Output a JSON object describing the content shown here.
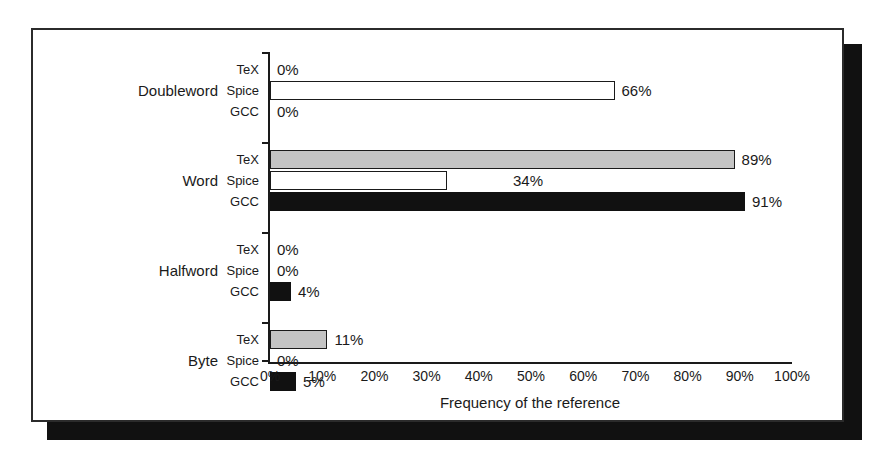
{
  "figure": {
    "x_axis_title": "Frequency of the reference",
    "frame_color": "#2b2b2b",
    "shadow_color": "#111111"
  },
  "chart_data": {
    "type": "bar",
    "orientation": "horizontal",
    "title": "",
    "subtitle": "",
    "xlabel": "Frequency of the reference",
    "ylabel": "",
    "xlim": [
      0,
      100
    ],
    "x_tick_labels": [
      "0%",
      "10%",
      "20%",
      "30%",
      "40%",
      "50%",
      "60%",
      "70%",
      "80%",
      "90%",
      "100%"
    ],
    "x_ticks": [
      0,
      10,
      20,
      30,
      40,
      50,
      60,
      70,
      80,
      90,
      100
    ],
    "grid": false,
    "legend_position": "none",
    "categories": [
      "Doubleword",
      "Word",
      "Halfword",
      "Byte"
    ],
    "series": [
      {
        "name": "TeX",
        "color": "#c4c4c4",
        "values": [
          0,
          89,
          0,
          11
        ]
      },
      {
        "name": "Spice",
        "color": "#ffffff",
        "values": [
          66,
          34,
          0,
          0
        ]
      },
      {
        "name": "GCC",
        "color": "#111111",
        "values": [
          0,
          91,
          4,
          5
        ]
      }
    ],
    "data_labels": {
      "Doubleword": {
        "TeX": "0%",
        "Spice": "66%",
        "GCC": "0%"
      },
      "Word": {
        "TeX": "89%",
        "Spice": "34%",
        "GCC": "91%"
      },
      "Halfword": {
        "TeX": "0%",
        "Spice": "0%",
        "GCC": "4%"
      },
      "Byte": {
        "TeX": "11%",
        "Spice": "0%",
        "GCC": "5%"
      }
    }
  },
  "groups": [
    {
      "label": "Doubleword",
      "bars": [
        {
          "series": "TeX",
          "value": 0,
          "label": "0%",
          "style": "tex",
          "inside": false
        },
        {
          "series": "Spice",
          "value": 66,
          "label": "66%",
          "style": "spice",
          "inside": false
        },
        {
          "series": "GCC",
          "value": 0,
          "label": "0%",
          "style": "gcc",
          "inside": false
        }
      ]
    },
    {
      "label": "Word",
      "bars": [
        {
          "series": "TeX",
          "value": 89,
          "label": "89%",
          "style": "tex",
          "inside": false
        },
        {
          "series": "Spice",
          "value": 34,
          "label": "34%",
          "style": "spice",
          "inside": true
        },
        {
          "series": "GCC",
          "value": 91,
          "label": "91%",
          "style": "gcc",
          "inside": false
        }
      ]
    },
    {
      "label": "Halfword",
      "bars": [
        {
          "series": "TeX",
          "value": 0,
          "label": "0%",
          "style": "tex",
          "inside": false
        },
        {
          "series": "Spice",
          "value": 0,
          "label": "0%",
          "style": "spice",
          "inside": false
        },
        {
          "series": "GCC",
          "value": 4,
          "label": "4%",
          "style": "gcc",
          "inside": false
        }
      ]
    },
    {
      "label": "Byte",
      "bars": [
        {
          "series": "TeX",
          "value": 11,
          "label": "11%",
          "style": "tex",
          "inside": false
        },
        {
          "series": "Spice",
          "value": 0,
          "label": "0%",
          "style": "spice",
          "inside": false
        },
        {
          "series": "GCC",
          "value": 5,
          "label": "5%",
          "style": "gcc",
          "inside": false
        }
      ]
    }
  ]
}
